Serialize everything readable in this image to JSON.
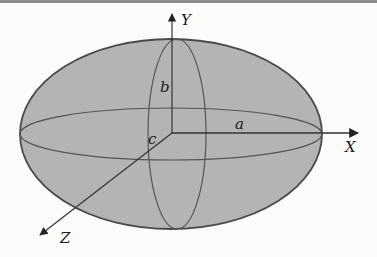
{
  "figure": {
    "colors": {
      "background": "#fbfbfa",
      "fill": "#b4b4b4",
      "outline": "#4a4a4a",
      "axis": "#333333",
      "top_rule": "#8a8a8a"
    },
    "axes": {
      "x_label": "X",
      "y_label": "Y",
      "z_label": "Z"
    },
    "semi_axes": {
      "a_label": "a",
      "b_label": "b",
      "c_label": "c"
    }
  }
}
